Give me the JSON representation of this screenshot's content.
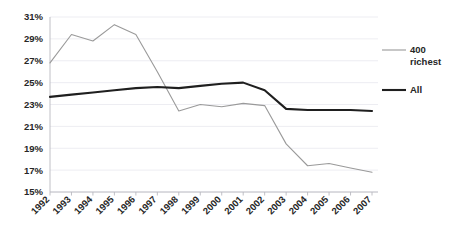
{
  "chart_data": {
    "type": "line",
    "title": "",
    "subtitle": "",
    "xlabel": "",
    "ylabel": "",
    "x": [
      "1992",
      "1993",
      "1994",
      "1995",
      "1996",
      "1997",
      "1998",
      "1999",
      "2000",
      "2001",
      "2002",
      "2003",
      "2004",
      "2005",
      "2006",
      "2007"
    ],
    "categories": [
      "1992",
      "1993",
      "1994",
      "1995",
      "1996",
      "1997",
      "1998",
      "1999",
      "2000",
      "2001",
      "2002",
      "2003",
      "2004",
      "2005",
      "2006",
      "2007"
    ],
    "series": [
      {
        "name": "400 richest",
        "color": "#9a9a9a",
        "line_width": 1.1,
        "values": [
          26.8,
          29.4,
          28.8,
          30.3,
          29.4,
          26.0,
          22.4,
          23.0,
          22.8,
          23.1,
          22.9,
          19.4,
          17.4,
          17.6,
          17.2,
          16.8
        ]
      },
      {
        "name": "All",
        "color": "#1f1f1f",
        "line_width": 2.1,
        "values": [
          23.7,
          23.9,
          24.1,
          24.3,
          24.5,
          24.6,
          24.5,
          24.7,
          24.9,
          25.0,
          24.3,
          22.6,
          22.5,
          22.5,
          22.5,
          22.4
        ]
      }
    ],
    "ylim": [
      15,
      31
    ],
    "ytick_values": [
      15,
      17,
      19,
      21,
      23,
      25,
      27,
      29,
      31
    ],
    "ytick_labels": [
      "15%",
      "17%",
      "19%",
      "21%",
      "23%",
      "25%",
      "27%",
      "29%",
      "31%"
    ],
    "grid": true,
    "grid_axis": "y",
    "legend_position": "right",
    "legend_entries": [
      "400 richest",
      "All"
    ],
    "value_suffix": "%"
  },
  "legend": {
    "entry_1_line_1": "400",
    "entry_1_line_2": "richest",
    "entry_2_line_1": "All"
  }
}
